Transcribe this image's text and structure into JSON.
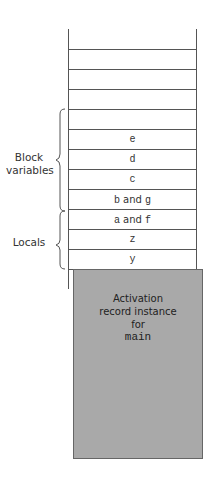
{
  "diagram": {
    "empty_rows": 4,
    "rows": [
      {
        "label": "e",
        "group": "block"
      },
      {
        "label": "d",
        "group": "block"
      },
      {
        "label": "c",
        "group": "block"
      },
      {
        "label_parts": [
          "b",
          " and ",
          "g"
        ],
        "group": "block"
      },
      {
        "label_parts": [
          "a",
          " and ",
          "f"
        ],
        "group": "block"
      },
      {
        "label": "z",
        "group": "locals"
      },
      {
        "label": "y",
        "group": "locals"
      },
      {
        "label": "x",
        "group": "locals"
      }
    ],
    "groups": {
      "block": {
        "label_line1": "Block",
        "label_line2": "variables"
      },
      "locals": {
        "label": "Locals"
      }
    },
    "activation_record": {
      "line1": "Activation",
      "line2": "record instance",
      "line3": "for",
      "line4": "main",
      "fill_color": "#a9a9a9"
    }
  }
}
